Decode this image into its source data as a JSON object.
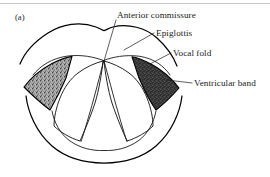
{
  "figure": {
    "panel_tag": "(a)",
    "title_hidden": "",
    "background_color": "#ffffff",
    "ink_color": "#000000",
    "scan_artifact_color": "#c9c9c9"
  },
  "labels": [
    {
      "id": "anterior-commissure",
      "text": "Anterior commissure",
      "x": 117,
      "y": 18,
      "leader_from": [
        116,
        20
      ],
      "leader_to": [
        104,
        61
      ]
    },
    {
      "id": "epiglottis",
      "text": "Epiglottis",
      "x": 156,
      "y": 36,
      "leader_from": [
        154,
        33
      ],
      "leader_to": [
        124,
        50
      ]
    },
    {
      "id": "vocal-fold",
      "text": "Vocal fold",
      "x": 173,
      "y": 56,
      "leader_from": [
        171,
        53
      ],
      "leader_to": [
        150,
        64
      ]
    },
    {
      "id": "ventricular-band",
      "text": "Ventricular band",
      "x": 194,
      "y": 86,
      "leader_from": [
        192,
        83
      ],
      "leader_to": [
        167,
        80
      ]
    }
  ],
  "regions": {
    "ventricular_band_left": {
      "name": "left-ventricular-band",
      "fill_color": "#9a9a9a",
      "texture": "speckled-light"
    },
    "ventricular_band_right": {
      "name": "right-ventricular-band",
      "fill_color": "#3d3d3d",
      "texture": "speckled-dark"
    },
    "glottis": {
      "name": "glottic-aperture",
      "fill_color": "#ffffff"
    }
  }
}
